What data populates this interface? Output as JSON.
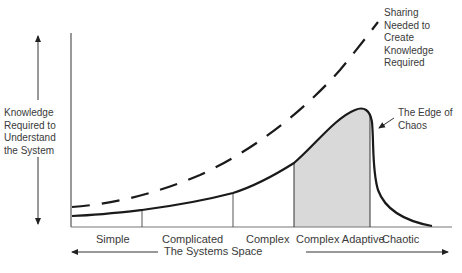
{
  "diagram": {
    "title": "",
    "y_axis_label": "Knowledge Required to Understand the System",
    "x_axis_label": "The Systems Space",
    "categories": [
      {
        "label": "Simple"
      },
      {
        "label": "Complicated"
      },
      {
        "label": "Complex"
      },
      {
        "label": "Complex Adaptive"
      },
      {
        "label": "Chaotic"
      }
    ],
    "annotations": {
      "dashed_curve": "Sharing Needed to Create Knowledge Required",
      "edge_of_chaos": "The Edge of Chaos"
    },
    "curves": [
      {
        "name": "Knowledge required (solid)",
        "style": "solid"
      },
      {
        "name": "Sharing needed (dashed)",
        "style": "dashed"
      }
    ],
    "highlight_region": "Complex Adaptive",
    "colors": {
      "line": "#1a1a1a",
      "shade": "#d9d9d9",
      "axis": "#555555"
    }
  }
}
